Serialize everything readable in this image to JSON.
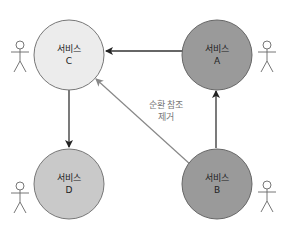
{
  "diagram": {
    "nodes": [
      {
        "id": "C",
        "title": "서비스",
        "letter": "C",
        "fill": "#ececec"
      },
      {
        "id": "A",
        "title": "서비스",
        "letter": "A",
        "fill": "#9a9a9a"
      },
      {
        "id": "D",
        "title": "서비스",
        "letter": "D",
        "fill": "#c9c9c9"
      },
      {
        "id": "B",
        "title": "서비스",
        "letter": "B",
        "fill": "#9a9a9a"
      }
    ],
    "edges": [
      {
        "from": "A",
        "to": "C",
        "style": "solid",
        "color": "#222222"
      },
      {
        "from": "C",
        "to": "D",
        "style": "solid",
        "color": "#222222"
      },
      {
        "from": "B",
        "to": "A",
        "style": "solid",
        "color": "#222222"
      },
      {
        "from": "B",
        "to": "C",
        "style": "solid",
        "color": "#888888",
        "label_line1": "순환 참조",
        "label_line2": "제거"
      }
    ],
    "actors": [
      {
        "attached_to": "C",
        "side": "left"
      },
      {
        "attached_to": "A",
        "side": "right"
      },
      {
        "attached_to": "D",
        "side": "left"
      },
      {
        "attached_to": "B",
        "side": "right"
      }
    ]
  }
}
